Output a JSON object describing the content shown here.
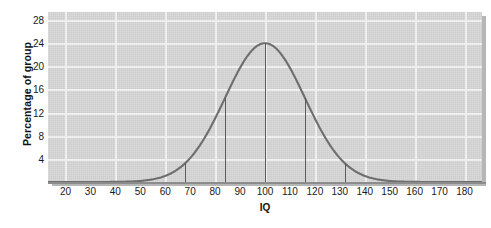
{
  "chart_data": {
    "type": "line",
    "title": "",
    "subtitle": "",
    "xlabel": "IQ",
    "ylabel": "Percentage of group",
    "xlim": [
      13,
      187
    ],
    "ylim": [
      0,
      29.4
    ],
    "xticks": [
      20,
      30,
      40,
      50,
      60,
      70,
      80,
      90,
      100,
      110,
      120,
      130,
      140,
      150,
      160,
      170,
      180
    ],
    "yticks": [
      4,
      8,
      12,
      16,
      20,
      24,
      28
    ],
    "xtick_labels": [
      "20",
      "30",
      "40",
      "50",
      "60",
      "70",
      "80",
      "90",
      "100",
      "110",
      "120",
      "130",
      "140",
      "150",
      "160",
      "170",
      "180"
    ],
    "ytick_labels": [
      "4",
      "8",
      "12",
      "16",
      "20",
      "24",
      "28"
    ],
    "grid": true,
    "grid_x_every": 20,
    "grid_y_every": 4,
    "legend": "none",
    "distribution": {
      "kind": "normal",
      "mean": 100,
      "sd": 16,
      "peak_value": 24
    },
    "series": [
      {
        "name": "IQ distribution",
        "color": "#6e6e6e",
        "x": [
          13,
          20,
          30,
          40,
          50,
          60,
          68,
          70,
          80,
          84,
          90,
          100,
          110,
          116,
          120,
          130,
          132,
          140,
          150,
          160,
          170,
          180,
          187
        ],
        "values": [
          0.1,
          0.2,
          0.6,
          1.6,
          3.5,
          6.6,
          9.6,
          10.5,
          14.5,
          16.0,
          18.3,
          24.0,
          18.3,
          16.0,
          14.5,
          10.5,
          9.6,
          6.6,
          3.5,
          1.6,
          0.6,
          0.2,
          0.1
        ]
      }
    ],
    "marker_lines": [
      {
        "x": 68,
        "label": "-2 SD",
        "top_value": 9.6
      },
      {
        "x": 84,
        "label": "-1 SD",
        "top_value": 16.0
      },
      {
        "x": 100,
        "label": "mean",
        "top_value": 24.0
      },
      {
        "x": 116,
        "label": "+1 SD",
        "top_value": 16.0
      },
      {
        "x": 132,
        "label": "+2 SD",
        "top_value": 9.6
      }
    ],
    "colors": {
      "plot_background": "#d6d6d6",
      "gridline": "#f2f2f2",
      "curve": "#6e6e6e",
      "marker": "#5a5a5a",
      "axis": "#8c8c8c",
      "text": "#1a1a1a",
      "shadow": "#a9a9a9"
    }
  }
}
